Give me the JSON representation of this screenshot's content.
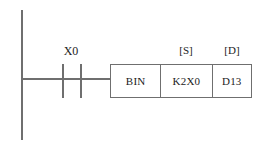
{
  "diagram": {
    "type": "ladder-diagram",
    "colors": {
      "background": "#ffffff",
      "line": "#6f6f6f",
      "text": "#1c1c1c"
    },
    "left_rail": {
      "name": "left-power-rail"
    },
    "contact": {
      "label": "X0",
      "type": "normally-open"
    },
    "operand_tags": {
      "source": "[S]",
      "destination": "[D]"
    },
    "instruction_box": {
      "cells": [
        {
          "key": "operation",
          "value": "BIN"
        },
        {
          "key": "source",
          "value": "K2X0"
        },
        {
          "key": "destination",
          "value": "D13"
        }
      ]
    }
  }
}
